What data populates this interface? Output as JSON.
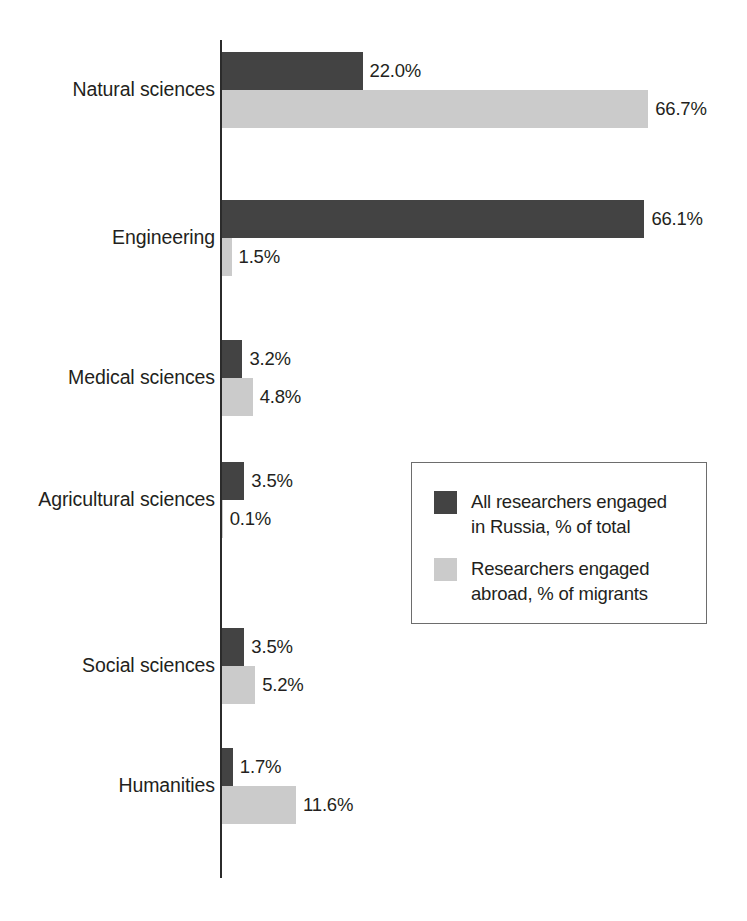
{
  "chart_data": {
    "type": "bar",
    "orientation": "horizontal",
    "title": "",
    "subtitle": "",
    "xlabel": "",
    "ylabel": "",
    "xlim": [
      0,
      70
    ],
    "grid": false,
    "legend_position": "middle-right",
    "categories": [
      "Natural sciences",
      "Engineering",
      "Medical sciences",
      "Agricultural sciences",
      "Social sciences",
      "Humanities"
    ],
    "series": [
      {
        "name": "All researchers engaged in Russia, % of total",
        "color": "#434343",
        "values": [
          22.0,
          66.1,
          3.2,
          3.5,
          3.5,
          1.7
        ],
        "labels": [
          "22.0%",
          "66.1%",
          "3.2%",
          "3.5%",
          "3.5%",
          "1.7%"
        ]
      },
      {
        "name": "Researchers engaged abroad, % of migrants",
        "color": "#cbcbcb",
        "values": [
          66.7,
          1.5,
          4.8,
          0.1,
          5.2,
          11.6
        ],
        "labels": [
          "66.7%",
          "1.5%",
          "4.8%",
          "0.1%",
          "5.2%",
          "11.6%"
        ]
      }
    ]
  },
  "legend": {
    "entries": [
      {
        "swatch": "dark",
        "label": "All researchers engaged\nin Russia, % of total"
      },
      {
        "swatch": "light",
        "label": "Researchers engaged\nabroad, % of migrants"
      }
    ]
  },
  "caption": {
    "text": ""
  },
  "colors": {
    "series_dark": "#434343",
    "series_light": "#cbcbcb",
    "axis": "#2b2b2b",
    "text": "#231f20",
    "legend_border": "#6d6d6d",
    "background": "#ffffff"
  }
}
